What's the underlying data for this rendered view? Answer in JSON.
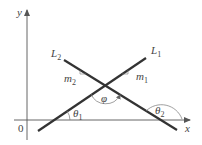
{
  "diagram": {
    "axes": {
      "x_label": "x",
      "y_label": "y",
      "origin_label": "0"
    },
    "lines": [
      {
        "name": "L",
        "subscript": "1",
        "slope_label": "m",
        "slope_subscript": "1"
      },
      {
        "name": "L",
        "subscript": "2",
        "slope_label": "m",
        "slope_subscript": "2"
      }
    ],
    "angles": {
      "theta1": {
        "symbol": "θ",
        "subscript": "1"
      },
      "theta2": {
        "symbol": "θ",
        "subscript": "2"
      },
      "phi": {
        "symbol": "φ"
      }
    },
    "colors": {
      "line": "#333333",
      "axis": "#555555",
      "text": "#444444"
    }
  }
}
